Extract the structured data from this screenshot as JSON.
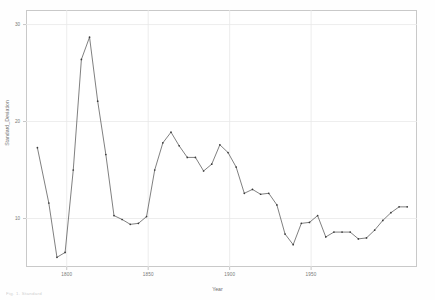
{
  "figure": {
    "background": "#ffffff",
    "frame_color": "#c9c9c9",
    "line_color": "#3a3a3a",
    "grid_color": "#e8e8e8",
    "footer_note": "Fig. 1. Standard"
  },
  "chart_data": {
    "type": "line",
    "title": "",
    "xlabel": "Year",
    "ylabel": "Standard_Deviation",
    "xlim": [
      1775,
      2015
    ],
    "ylim": [
      5.0,
      31.5
    ],
    "xticks": [
      1800,
      1850,
      1900,
      1950
    ],
    "xticklabels": [
      "1800",
      "1850",
      "1900",
      "1950"
    ],
    "yticks": [
      10,
      20,
      30
    ],
    "yticklabels": [
      "10",
      "20",
      "30"
    ],
    "grid": true,
    "legend": null,
    "markers": true,
    "series": [
      {
        "name": "Standard_Deviation",
        "x": [
          1782,
          1789,
          1794,
          1799,
          1804,
          1809,
          1814,
          1819,
          1824,
          1829,
          1834,
          1839,
          1844,
          1849,
          1854,
          1859,
          1864,
          1869,
          1874,
          1879,
          1884,
          1889,
          1894,
          1899,
          1904,
          1909,
          1914,
          1919,
          1924,
          1929,
          1934,
          1939,
          1944,
          1949,
          1954,
          1959,
          1964,
          1969,
          1974,
          1979,
          1984,
          1989,
          1994,
          1999,
          2004,
          2009
        ],
        "y": [
          17.3,
          11.6,
          6.0,
          6.5,
          15.0,
          26.4,
          28.7,
          22.1,
          16.6,
          10.3,
          9.9,
          9.4,
          9.5,
          10.2,
          15.0,
          17.8,
          18.9,
          17.5,
          16.3,
          16.3,
          14.9,
          15.6,
          17.6,
          16.8,
          15.3,
          12.6,
          13.0,
          12.5,
          12.6,
          11.4,
          8.4,
          7.3,
          9.5,
          9.6,
          10.3,
          8.1,
          8.6,
          8.6,
          8.6,
          7.9,
          8.0,
          8.8,
          9.8,
          10.6,
          11.2,
          11.2
        ]
      }
    ]
  }
}
